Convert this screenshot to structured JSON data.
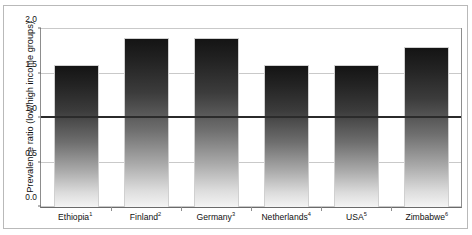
{
  "figure": {
    "bleed_top_text": "",
    "bleed_bottom_text": ""
  },
  "chart_data": {
    "type": "bar",
    "title": "",
    "xlabel": "",
    "ylabel": "Prevalence ratio (low/high income groups)",
    "categories": [
      "Ethiopia",
      "Finland",
      "Germany",
      "Netherlands",
      "USA",
      "Zimbabwe"
    ],
    "category_footnotes": [
      "1",
      "2",
      "3",
      "4",
      "5",
      "6"
    ],
    "category_labels": [
      "Ethiopia1",
      "Finland2",
      "Germany3",
      "Netherlands4",
      "USA5",
      "Zimbabwe6"
    ],
    "values": [
      1.6,
      1.9,
      1.9,
      1.6,
      1.6,
      1.8
    ],
    "ylim": [
      0.0,
      2.0
    ],
    "yticks": [
      0.0,
      0.5,
      1.0,
      1.5,
      2.0
    ],
    "ytick_labels": [
      "0.0",
      "0.5",
      "1.0",
      "1.5",
      "2.0"
    ],
    "grid": true,
    "legend": "none",
    "reference_line": {
      "value": 1.0,
      "style": "bold-solid",
      "color": "#2b2b2b"
    },
    "bar_style": {
      "fill": "vertical-gradient",
      "gradient_top_color": "#141414",
      "gradient_bottom_color": "#f4f4f4",
      "outline_color": "#d0d0d0"
    },
    "axis_color": "#8d8d8d",
    "gridline_color": "#c9c9c9",
    "frame_color": "#b9b9b9"
  }
}
